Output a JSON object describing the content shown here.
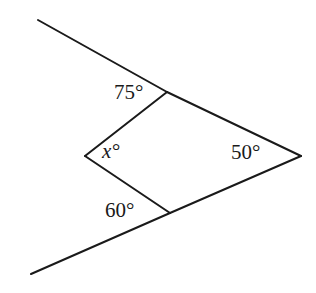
{
  "figure": {
    "type": "geometry-diagram",
    "background_color": "#ffffff",
    "stroke_color": "#1a1a1a",
    "stroke_width": 2,
    "width": 316,
    "height": 293
  },
  "points": {
    "top_vertex": {
      "x": 167,
      "y": 92
    },
    "left_vertex": {
      "x": 85,
      "y": 156
    },
    "bottom_vertex": {
      "x": 170,
      "y": 213
    },
    "right_vertex": {
      "x": 301,
      "y": 156
    },
    "upper_ray_end": {
      "x": 38,
      "y": 20
    },
    "lower_ray_end": {
      "x": 31,
      "y": 274
    }
  },
  "paths": {
    "upper_ray": "M 38 20 L 167 92",
    "lower_ray": "M 31 274 L 170 213",
    "top_left_side": "M 167 92 L 85 156",
    "bottom_left_side": "M 85 156 L 170 213",
    "top_right_side": "M 167 92 L 301 156",
    "bottom_right_side": "M 170 213 L 301 156"
  },
  "labels": {
    "angle_top": "75°",
    "angle_left": "x°",
    "angle_bottom": "60°",
    "angle_right": "50°"
  }
}
